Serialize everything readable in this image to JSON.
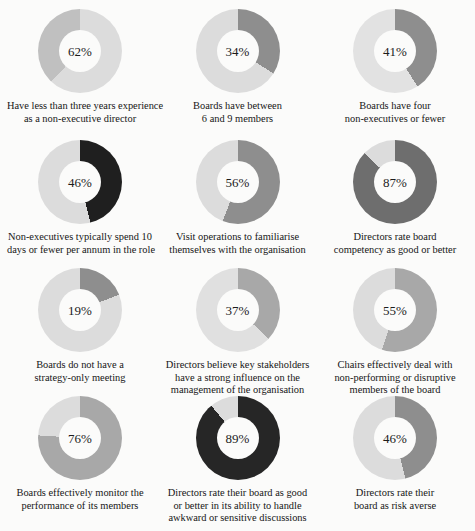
{
  "chart_data": {
    "type": "pie",
    "title": "",
    "layout": {
      "rows": 4,
      "columns": 3,
      "style": "donut",
      "start_angle_deg": 0,
      "direction": "clockwise"
    },
    "charts": [
      {
        "value": 62,
        "label": "62%",
        "remainder": 38,
        "arc_color": "#dcdcdc",
        "rest_color": "#c0c0c0",
        "caption_lines": [
          "Have less than three years experience",
          "as a non-executive director"
        ]
      },
      {
        "value": 34,
        "label": "34%",
        "remainder": 66,
        "arc_color": "#8e8e8e",
        "rest_color": "#dcdcdc",
        "caption_lines": [
          "Boards have between",
          "6 and 9 members"
        ]
      },
      {
        "value": 41,
        "label": "41%",
        "remainder": 59,
        "arc_color": "#8e8e8e",
        "rest_color": "#e2e2e2",
        "caption_lines": [
          "Boards have four",
          "non-executives or fewer"
        ]
      },
      {
        "value": 46,
        "label": "46%",
        "remainder": 54,
        "arc_color": "#1f1f1f",
        "rest_color": "#dcdcdc",
        "caption_lines": [
          "Non-executives typically spend 10",
          "days or fewer per annum in the role"
        ]
      },
      {
        "value": 56,
        "label": "56%",
        "remainder": 44,
        "arc_color": "#8e8e8e",
        "rest_color": "#dcdcdc",
        "caption_lines": [
          "Visit operations to familiarise",
          "themselves with the organisation"
        ]
      },
      {
        "value": 87,
        "label": "87%",
        "remainder": 13,
        "arc_color": "#6e6e6e",
        "rest_color": "#dcdcdc",
        "caption_lines": [
          "Directors rate board",
          "competency as good or better"
        ]
      },
      {
        "value": 19,
        "label": "19%",
        "remainder": 81,
        "arc_color": "#8e8e8e",
        "rest_color": "#dcdcdc",
        "caption_lines": [
          "Boards do not have a",
          "strategy-only meeting"
        ]
      },
      {
        "value": 37,
        "label": "37%",
        "remainder": 63,
        "arc_color": "#a8a8a8",
        "rest_color": "#e0e0e0",
        "caption_lines": [
          "Directors believe key stakeholders",
          "have a strong influence on the",
          "management of the organisation"
        ]
      },
      {
        "value": 55,
        "label": "55%",
        "remainder": 45,
        "arc_color": "#a8a8a8",
        "rest_color": "#dcdcdc",
        "caption_lines": [
          "Chairs effectively deal with",
          "non-performing or disruptive",
          "members of the board"
        ]
      },
      {
        "value": 76,
        "label": "76%",
        "remainder": 24,
        "arc_color": "#a8a8a8",
        "rest_color": "#dcdcdc",
        "caption_lines": [
          "Boards effectively monitor the",
          "performance of its members"
        ]
      },
      {
        "value": 89,
        "label": "89%",
        "remainder": 11,
        "arc_color": "#262626",
        "rest_color": "#dcdcdc",
        "caption_lines": [
          "Directors rate their board as good",
          "or better in its ability to handle",
          "awkward or sensitive discussions"
        ]
      },
      {
        "value": 46,
        "label": "46%",
        "remainder": 54,
        "arc_color": "#8e8e8e",
        "rest_color": "#dcdcdc",
        "caption_lines": [
          "Directors rate their",
          "board as risk averse"
        ]
      }
    ]
  }
}
